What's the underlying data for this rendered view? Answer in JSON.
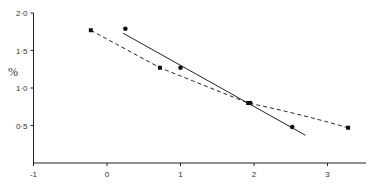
{
  "chart_data": {
    "type": "line",
    "title": "",
    "xlabel": "",
    "ylabel": "%",
    "xlim": [
      -1,
      3.4
    ],
    "ylim": [
      0,
      2.0
    ],
    "x_ticks": [
      "-1",
      "0",
      "1",
      "2",
      "3"
    ],
    "y_ticks": [
      "0·5",
      "1·0",
      "1·5",
      "2·0"
    ],
    "grid": false,
    "legend": null,
    "series": [
      {
        "name": "dashed curve (square markers)",
        "style": "dashed",
        "marker": "square",
        "x": [
          -0.22,
          0.72,
          1.92,
          3.28
        ],
        "y": [
          1.77,
          1.27,
          0.8,
          0.47
        ]
      },
      {
        "name": "solid regression line (circle markers)",
        "style": "solid",
        "marker": "circle",
        "x": [
          0.25,
          1.0,
          1.95,
          2.52
        ],
        "y": [
          1.79,
          1.27,
          0.8,
          0.48
        ],
        "line_endpoints": {
          "x": [
            0.22,
            2.7
          ],
          "y": [
            1.73,
            0.37
          ]
        }
      }
    ]
  }
}
